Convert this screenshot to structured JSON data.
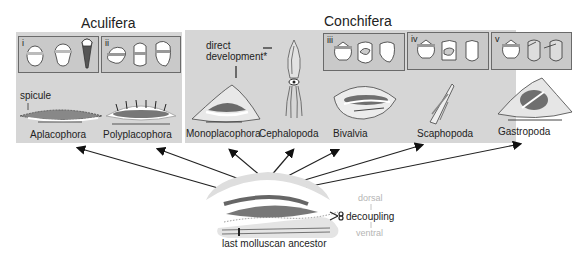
{
  "groups": {
    "aculifera": "Aculifera",
    "conchifera": "Conchifera"
  },
  "stages": [
    "i",
    "ii",
    "iii",
    "iv",
    "v"
  ],
  "annotations": {
    "spicule": "spicule",
    "direct_development": [
      "direct",
      "development*"
    ]
  },
  "taxa": [
    {
      "name": "Aplacophora",
      "group": "Aculifera"
    },
    {
      "name": "Polyplacophora",
      "group": "Aculifera"
    },
    {
      "name": "Monoplacophora",
      "group": "Conchifera"
    },
    {
      "name": "Cephalopoda",
      "group": "Conchifera"
    },
    {
      "name": "Bivalvia",
      "group": "Conchifera"
    },
    {
      "name": "Scaphopoda",
      "group": "Conchifera"
    },
    {
      "name": "Gastropoda",
      "group": "Conchifera"
    }
  ],
  "ancestor": {
    "label": "last molluscan ancestor",
    "decoupling": "decoupling",
    "dorsal": "dorsal",
    "ventral": "ventral"
  },
  "colors": {
    "panel": "#d6d6d6",
    "stage_box": "#c9c9c9",
    "shell_dark": "#6f6f6f",
    "faint_text": "#b5b5b5"
  }
}
